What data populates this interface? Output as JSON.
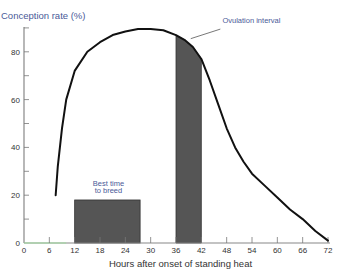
{
  "chart_data": {
    "type": "line",
    "title": "",
    "ylabel": "Conception rate (%)",
    "xlabel": "Hours after onset of standing heat",
    "xlim": [
      0,
      72
    ],
    "ylim": [
      0,
      90
    ],
    "x_ticks": [
      0,
      6,
      12,
      18,
      24,
      30,
      36,
      42,
      48,
      54,
      60,
      66,
      72
    ],
    "y_ticks": [
      0,
      20,
      40,
      60,
      80
    ],
    "grid": false,
    "series": [
      {
        "name": "Conception rate",
        "x": [
          7.5,
          8,
          9,
          10,
          12,
          15,
          18,
          21,
          24,
          27,
          30,
          33,
          36,
          38,
          40,
          42,
          44,
          46,
          48,
          50,
          52,
          54,
          57,
          60,
          63,
          66,
          69,
          72
        ],
        "y": [
          20,
          32,
          48,
          60,
          72,
          80,
          84,
          87,
          88.5,
          89.5,
          89.5,
          89,
          87,
          85,
          82,
          77,
          68,
          58,
          48,
          40,
          34,
          29,
          24,
          19,
          14,
          10,
          5,
          1
        ]
      }
    ],
    "regions": [
      {
        "label": "Best time to breed",
        "x_start": 12,
        "x_end": 27.5,
        "height": 18
      },
      {
        "label": "Ovulation interval",
        "x_start": 36,
        "x_end": 42,
        "height": "curve"
      }
    ],
    "annotations": [
      {
        "text": "Best time",
        "x": 20,
        "y": 24
      },
      {
        "text": "to breed",
        "x": 20,
        "y": 21
      },
      {
        "text": "Ovulation interval",
        "x": 47,
        "y": 92
      }
    ]
  }
}
